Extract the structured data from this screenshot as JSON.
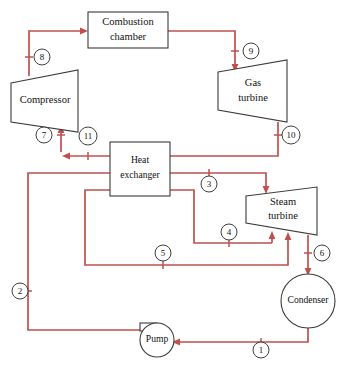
{
  "diagram": {
    "canvas": {
      "width": 353,
      "height": 373,
      "background": "#ffffff"
    },
    "colors": {
      "pipe": "#c0504d",
      "outline": "#3b3b3b",
      "label_outline": "#2b2b2b",
      "text": "#111111",
      "background": "#ffffff"
    },
    "components": [
      {
        "id": "combustion-chamber",
        "shape": "rectangle",
        "line1": "Combustion",
        "line2": "chamber"
      },
      {
        "id": "compressor",
        "shape": "trapezoid",
        "line1": "Compressor",
        "line2": ""
      },
      {
        "id": "gas-turbine",
        "shape": "trapezoid",
        "line1": "Gas",
        "line2": "turbine"
      },
      {
        "id": "heat-exchanger",
        "shape": "rectangle",
        "line1": "Heat",
        "line2": "exchanger"
      },
      {
        "id": "steam-turbine",
        "shape": "trapezoid",
        "line1": "Steam",
        "line2": "turbine"
      },
      {
        "id": "condenser",
        "shape": "circle",
        "line1": "Condenser",
        "line2": ""
      },
      {
        "id": "pump",
        "shape": "circle-with-tab",
        "line1": "Pump",
        "line2": ""
      }
    ],
    "state_points": [
      {
        "id": "1",
        "label": "1",
        "cx": 261,
        "cy": 350
      },
      {
        "id": "2",
        "label": "2",
        "cx": 20,
        "cy": 291
      },
      {
        "id": "3",
        "label": "3",
        "cx": 209,
        "cy": 184
      },
      {
        "id": "4",
        "label": "4",
        "cx": 229,
        "cy": 232
      },
      {
        "id": "5",
        "label": "5",
        "cx": 163,
        "cy": 253
      },
      {
        "id": "6",
        "label": "6",
        "cx": 322,
        "cy": 253
      },
      {
        "id": "7",
        "label": "7",
        "cx": 44,
        "cy": 135
      },
      {
        "id": "8",
        "label": "8",
        "cx": 42,
        "cy": 57
      },
      {
        "id": "9",
        "label": "9",
        "cx": 251,
        "cy": 51
      },
      {
        "id": "10",
        "label": "10",
        "cx": 291,
        "cy": 135
      },
      {
        "id": "11",
        "label": "11",
        "cx": 88,
        "cy": 136
      }
    ]
  }
}
